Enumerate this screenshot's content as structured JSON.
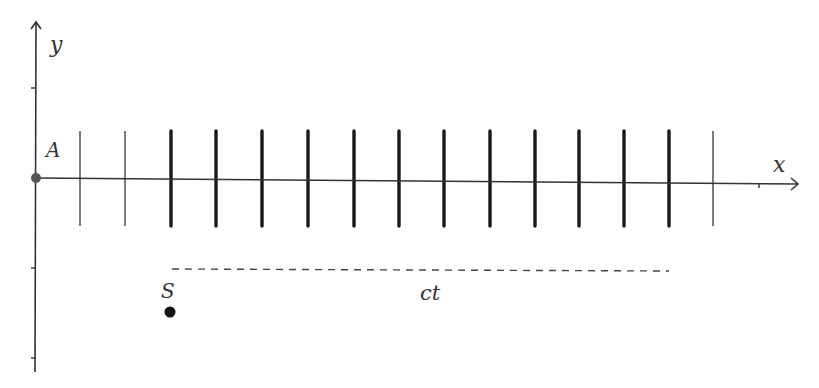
{
  "diagram": {
    "axes": {
      "x_label": "x",
      "y_label": "y",
      "origin": {
        "x": 36,
        "y": 178
      },
      "x_end": 798,
      "y_top": 22,
      "y_bottom": 372,
      "y_ticks": [
        88,
        268,
        358
      ],
      "x_ticks": [
        759
      ],
      "color": "#333333"
    },
    "points": [
      {
        "label": "A",
        "x": 36,
        "y": 178,
        "label_x": 46,
        "label_y": 157,
        "color": "#555555"
      },
      {
        "label": "S",
        "x": 170,
        "y": 312,
        "label_x": 161,
        "label_y": 298,
        "color": "#111111"
      }
    ],
    "thin_lines": [
      80,
      125,
      713
    ],
    "thick_lines": [
      171,
      216,
      262,
      308,
      354,
      399,
      444,
      490,
      535,
      579,
      624,
      669
    ],
    "line_top": 131,
    "line_bottom": 226,
    "dashed_segment": {
      "x1": 172,
      "x2": 669,
      "y": 269,
      "label": "ct",
      "label_x": 420,
      "label_y": 300
    },
    "colors": {
      "line": "#1a1a1a",
      "dashed": "#444444",
      "label": "#333333"
    }
  }
}
